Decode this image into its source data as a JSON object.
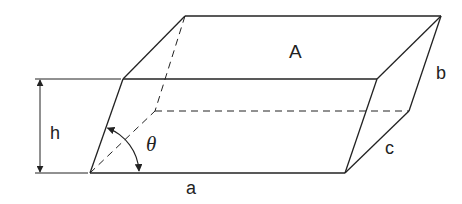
{
  "diagram": {
    "type": "parallelepiped-geometry",
    "colors": {
      "stroke": "#222222",
      "background": "#ffffff"
    },
    "labels": {
      "area": "A",
      "slant_edge": "b",
      "depth_edge": "c",
      "base_edge": "a",
      "height": "h",
      "angle": "θ"
    },
    "vertices": {
      "front_bottom_left": [
        90,
        173
      ],
      "front_bottom_right": [
        345,
        173
      ],
      "front_top_left": [
        123,
        79
      ],
      "front_top_right": [
        377,
        79
      ],
      "back_top_left": [
        185,
        16
      ],
      "back_top_right": [
        441,
        16
      ],
      "back_bottom_left_hidden": [
        155,
        111
      ],
      "back_bottom_right": [
        409,
        111
      ]
    }
  }
}
